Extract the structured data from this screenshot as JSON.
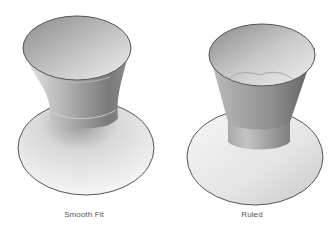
{
  "figures": [
    {
      "id": "smooth-fit",
      "caption": "Smooth Fit"
    },
    {
      "id": "ruled",
      "caption": "Ruled"
    }
  ],
  "colors": {
    "background": "#ffffff",
    "outline": "#555555",
    "caption": "#555555"
  }
}
